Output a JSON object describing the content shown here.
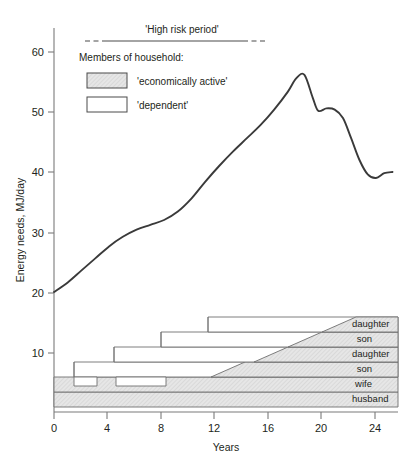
{
  "chart_data": {
    "type": "line",
    "title": "",
    "xlabel": "Years",
    "ylabel": "Energy needs, MJ/day",
    "xlim": [
      0,
      25
    ],
    "ylim": [
      0,
      64
    ],
    "xticks": [
      0,
      4,
      8,
      12,
      16,
      20,
      24
    ],
    "yticks": [
      10,
      20,
      30,
      40,
      50,
      60
    ],
    "grid": false,
    "legend_position": "top-left",
    "series": [
      {
        "name": "household energy needs",
        "x": [
          0,
          1,
          2,
          3,
          4,
          5,
          6,
          7,
          8,
          9,
          10,
          11,
          12,
          13,
          14,
          15,
          16,
          17,
          17.6,
          18.2,
          18.8,
          19.2,
          19.8,
          20.4,
          21,
          21.6,
          22.2,
          22.8,
          23.4,
          24,
          24.6
        ],
        "y": [
          20.0,
          21.6,
          23.6,
          25.6,
          27.6,
          29.2,
          30.4,
          31.2,
          32.0,
          33.4,
          35.6,
          38.4,
          41.0,
          43.4,
          45.6,
          47.8,
          50.4,
          53.4,
          55.6,
          56.2,
          52.4,
          50.2,
          50.6,
          50.4,
          49.0,
          45.6,
          42.0,
          39.6,
          39.0,
          39.8,
          40.0
        ]
      }
    ],
    "annotations": [
      {
        "name": "high-risk-period",
        "label": "'High risk period'",
        "x_start": 1.0,
        "x_end": 16.0,
        "style": "solid line with dashed ends"
      }
    ],
    "bands": {
      "note": "Stacked household members; hatched = 'economically active', white = 'dependent'",
      "members": [
        {
          "label": "husband",
          "status": "economically active",
          "x_start": 0,
          "x_end": 25
        },
        {
          "label": "wife",
          "status": "economically active",
          "x_start": 0,
          "x_end": 25
        },
        {
          "label": "son",
          "status": "dependent then economically active",
          "x_start": 1.5,
          "x_end": 25,
          "transition_start": 13.0,
          "transition_end": 15.5
        },
        {
          "label": "daughter",
          "status": "dependent then economically active",
          "x_start": 4.5,
          "x_end": 25,
          "transition_start": 15.0,
          "transition_end": 17.5
        },
        {
          "label": "son",
          "status": "dependent then economically active",
          "x_start": 8.0,
          "x_end": 25,
          "transition_start": 17.5,
          "transition_end": 20.0
        },
        {
          "label": "daughter",
          "status": "dependent then economically active",
          "x_start": 11.5,
          "x_end": 25,
          "transition_start": 20.0,
          "transition_end": 22.5
        }
      ]
    }
  },
  "axes": {
    "y_title": "Energy needs, MJ/day",
    "x_title": "Years",
    "x_tick_labels": [
      "0",
      "4",
      "8",
      "12",
      "16",
      "20",
      "24"
    ],
    "y_tick_labels": [
      "10",
      "20",
      "30",
      "40",
      "50",
      "60"
    ]
  },
  "legend": {
    "heading": "Members of household:",
    "items": [
      {
        "label": "'economically active'",
        "swatch": "hatched-grey",
        "color": "#e2e2e2"
      },
      {
        "label": "'dependent'",
        "swatch": "white",
        "color": "#ffffff"
      }
    ]
  },
  "annotation": {
    "high_risk_label": "'High risk period'"
  },
  "band_labels": [
    "daughter",
    "son",
    "daughter",
    "son",
    "wife",
    "husband"
  ],
  "colors": {
    "curve": "#3a3a3a",
    "axis": "#7a7a7a",
    "active_fill": "#e2e2e2",
    "dependent_fill": "#ffffff",
    "band_edge": "#6f6f6f",
    "text": "#231f20"
  }
}
